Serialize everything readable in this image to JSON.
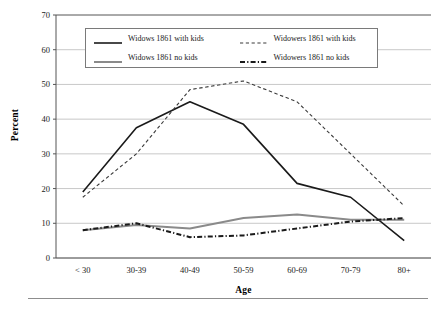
{
  "chart_data": {
    "type": "line",
    "title": "",
    "xlabel": "Age",
    "ylabel": "Percent",
    "categories": [
      "< 30",
      "30-39",
      "40-49",
      "50-59",
      "60-69",
      "70-79",
      "80+"
    ],
    "ylim": [
      0,
      70
    ],
    "yticks": [
      0,
      10,
      20,
      30,
      40,
      50,
      60,
      70
    ],
    "grid": "horizontal",
    "legend_position": "top-center-inside",
    "series": [
      {
        "name": "Widows 1861 with kids",
        "style": "solid",
        "color": "#1a1a1a",
        "width": 1.6,
        "values": [
          19,
          37.5,
          45,
          38.5,
          21.5,
          17.5,
          5
        ]
      },
      {
        "name": "Widowers 1861 with kids",
        "style": "dashed",
        "color": "#3a3a3a",
        "width": 1.1,
        "values": [
          17.5,
          30,
          48.5,
          51,
          45,
          30,
          15
        ]
      },
      {
        "name": "Widows 1861 no kids",
        "style": "solid",
        "color": "#8a8a8a",
        "width": 2.0,
        "values": [
          8,
          9.5,
          8.5,
          11.5,
          12.5,
          11,
          11
        ]
      },
      {
        "name": "Widowers 1861 no kids",
        "style": "dashdot",
        "color": "#1a1a1a",
        "width": 2.0,
        "values": [
          8,
          10,
          6,
          6.5,
          8.5,
          10.5,
          11.5
        ]
      }
    ]
  },
  "axes": {
    "y_tick_labels": [
      "0",
      "10",
      "20",
      "30",
      "40",
      "50",
      "60",
      "70"
    ],
    "x_tick_labels": [
      "< 30",
      "30-39",
      "40-49",
      "50-59",
      "60-69",
      "70-79",
      "80+"
    ],
    "y_title": "Percent",
    "x_title": "Age"
  },
  "legend": {
    "entries": [
      {
        "label": "Widows 1861 with kids"
      },
      {
        "label": "Widowers 1861 with kids"
      },
      {
        "label": "Widows 1861 no kids"
      },
      {
        "label": "Widowers 1861 no kids"
      }
    ]
  },
  "colors": {
    "gridline": "#c8c8c8",
    "axis": "#555555",
    "black_series": "#1a1a1a",
    "gray_series": "#8a8a8a",
    "legend_border": "#7a7a7a",
    "rule": "#8d8d8d"
  }
}
